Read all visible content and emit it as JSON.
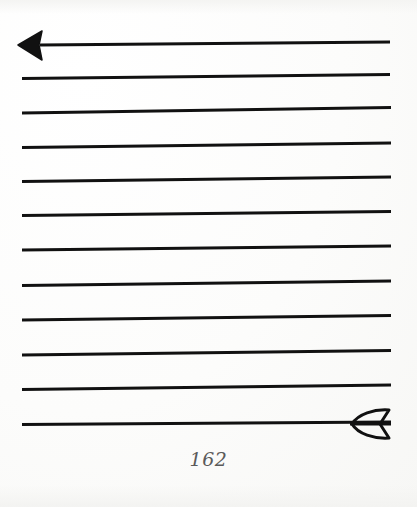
{
  "page": {
    "width": 417,
    "height": 507,
    "background_color": "#fdfdfc",
    "ink_color": "#111111",
    "page_number": "162",
    "page_number_color": "#5a5a5a"
  },
  "artwork": {
    "title": "arrow-across-ruled-lines",
    "description": "A long arrow rendered as a stack of ruled horizontal lines; a solid black arrowhead terminates the top line at the left, and an outlined fletching terminates the bottom line at the right.",
    "arrowhead": {
      "name": "arrowhead-left",
      "style": "solid-filled-triangle",
      "color": "#111111",
      "tip_x": 18,
      "tip_y": 45,
      "back_x": 42,
      "top_y": 31,
      "bottom_y": 60
    },
    "fletching": {
      "name": "arrow-fletching-right",
      "style": "outline-stroke",
      "color": "#111111",
      "stroke_width": 3,
      "left_x": 352,
      "right_x": 391,
      "top_y": 410,
      "bottom_y": 438,
      "center_y": 424
    },
    "rule_count": 12,
    "rules": [
      {
        "index": 1,
        "x1": 40,
        "y1": 45.0,
        "x2": 390,
        "y2": 42.0,
        "thickness": 3.0,
        "has_arrowhead": true,
        "has_fletching": false
      },
      {
        "index": 2,
        "x1": 22,
        "y1": 78.5,
        "x2": 390,
        "y2": 74.5,
        "thickness": 2.8,
        "has_arrowhead": false,
        "has_fletching": false
      },
      {
        "index": 3,
        "x1": 22,
        "y1": 113.0,
        "x2": 391,
        "y2": 107.5,
        "thickness": 2.8,
        "has_arrowhead": false,
        "has_fletching": false
      },
      {
        "index": 4,
        "x1": 22,
        "y1": 147.5,
        "x2": 391,
        "y2": 143.0,
        "thickness": 2.8,
        "has_arrowhead": false,
        "has_fletching": false
      },
      {
        "index": 5,
        "x1": 22,
        "y1": 181.5,
        "x2": 391,
        "y2": 177.0,
        "thickness": 2.8,
        "has_arrowhead": false,
        "has_fletching": false
      },
      {
        "index": 6,
        "x1": 22,
        "y1": 215.5,
        "x2": 391,
        "y2": 211.5,
        "thickness": 2.8,
        "has_arrowhead": false,
        "has_fletching": false
      },
      {
        "index": 7,
        "x1": 22,
        "y1": 250.0,
        "x2": 391,
        "y2": 246.0,
        "thickness": 2.8,
        "has_arrowhead": false,
        "has_fletching": false
      },
      {
        "index": 8,
        "x1": 22,
        "y1": 285.5,
        "x2": 391,
        "y2": 281.0,
        "thickness": 2.8,
        "has_arrowhead": false,
        "has_fletching": false
      },
      {
        "index": 9,
        "x1": 22,
        "y1": 320.0,
        "x2": 391,
        "y2": 315.5,
        "thickness": 2.8,
        "has_arrowhead": false,
        "has_fletching": false
      },
      {
        "index": 10,
        "x1": 22,
        "y1": 355.0,
        "x2": 391,
        "y2": 350.5,
        "thickness": 2.8,
        "has_arrowhead": false,
        "has_fletching": false
      },
      {
        "index": 11,
        "x1": 22,
        "y1": 389.5,
        "x2": 391,
        "y2": 385.0,
        "thickness": 2.8,
        "has_arrowhead": false,
        "has_fletching": false
      },
      {
        "index": 12,
        "x1": 22,
        "y1": 424.5,
        "x2": 391,
        "y2": 422.0,
        "thickness": 2.8,
        "has_arrowhead": false,
        "has_fletching": true
      }
    ]
  }
}
